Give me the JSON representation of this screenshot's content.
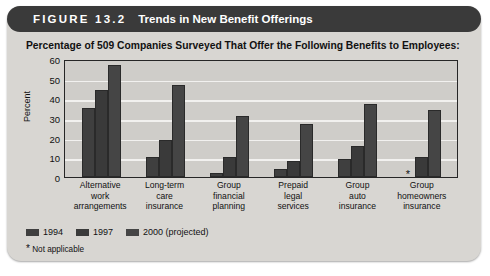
{
  "header": {
    "figure_label": "FIGURE 13.2",
    "title": "Trends in New Benefit Offerings"
  },
  "subtitle": "Percentage of 509 Companies Surveyed That Offer the Following Benefits to Employees:",
  "footnote": {
    "star": "*",
    "text": "Not applicable"
  },
  "legend": {
    "items": [
      {
        "label": "1994",
        "color": "#3f3f3f"
      },
      {
        "label": "1997",
        "color": "#3a3a3a"
      },
      {
        "label": "2000 (projected)",
        "color": "#454545"
      }
    ]
  },
  "chart_data": {
    "type": "bar",
    "title": "Trends in New Benefit Offerings",
    "subtitle": "Percentage of 509 Companies Surveyed That Offer the Following Benefits to Employees:",
    "xlabel": "",
    "ylabel": "Percent",
    "ylim": [
      0,
      60
    ],
    "yticks": [
      0,
      10,
      20,
      30,
      40,
      50,
      60
    ],
    "ytick_labels": [
      "0",
      "10",
      "20",
      "30",
      "40",
      "50",
      "60"
    ],
    "grid": true,
    "legend_position": "below-left",
    "categories": [
      "Alternative work arrangements",
      "Long-term care insurance",
      "Group financial planning",
      "Prepaid legal services",
      "Group auto insurance",
      "Group homeowners insurance"
    ],
    "category_lines": [
      [
        "Alternative",
        "work",
        "arrangements"
      ],
      [
        "Long-term",
        "care",
        "insurance"
      ],
      [
        "Group",
        "financial",
        "planning"
      ],
      [
        "Prepaid",
        "legal",
        "services"
      ],
      [
        "Group",
        "auto",
        "insurance"
      ],
      [
        "Group",
        "homeowners",
        "insurance"
      ]
    ],
    "series": [
      {
        "name": "1994",
        "values": [
          35,
          10,
          2,
          4,
          9,
          null
        ],
        "null_marker": "*"
      },
      {
        "name": "1997",
        "values": [
          44,
          19,
          10,
          8,
          16,
          10
        ]
      },
      {
        "name": "2000 (projected)",
        "values": [
          57,
          47,
          31,
          27,
          37,
          34
        ]
      }
    ],
    "annotations": [
      {
        "text": "* Not applicable",
        "target": "1994 / Group homeowners insurance"
      }
    ]
  }
}
